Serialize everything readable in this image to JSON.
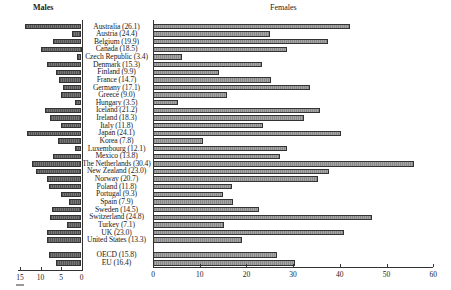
{
  "chart_data": {
    "type": "bar",
    "orientation": "horizontal",
    "layout": "back-to-back",
    "panels": [
      {
        "name": "Males",
        "axis_ticks": [
          15,
          10,
          5,
          0
        ],
        "xlim": [
          15,
          0
        ],
        "direction": "leftward"
      },
      {
        "name": "Females",
        "axis_ticks": [
          0,
          10,
          20,
          30,
          40,
          50,
          60
        ],
        "xlim": [
          0,
          60
        ],
        "direction": "rightward"
      }
    ],
    "categories": [
      "Australia (26.1)",
      "Austria (24.4)",
      "Belgium (19.9)",
      "Canada (18.5)",
      "Czech Republic (3.4)",
      "Denmark (15.3)",
      "Finland (9.9)",
      "France (14.7)",
      "Germany (17.1)",
      "Greece (9.0)",
      "Hungary (3.5)",
      "Iceland (21.2)",
      "Ireland (18.3)",
      "Italy (11.8)",
      "Japan (24.1)",
      "Korea (7.8)",
      "Luxembourg (12.1)",
      "Mexico (13.8)",
      "The Netherlands (30.4)",
      "New Zealand (23.0)",
      "Norway (20.7)",
      "Poland (11.8)",
      "Portugal (9.3)",
      "Spain (7.9)",
      "Sweden (14.5)",
      "Switzerland (24.8)",
      "Turkey (7.1)",
      "UK (23.0)",
      "United States (13.3)",
      "OECD (15.8)",
      "EU (16.4)"
    ],
    "series": [
      {
        "name": "Males",
        "values": [
          13.8,
          2.3,
          7.0,
          10.0,
          1.2,
          8.5,
          6.3,
          5.6,
          4.6,
          5.1,
          1.7,
          9.0,
          7.8,
          5.1,
          13.4,
          5.8,
          1.5,
          7.0,
          12.0,
          11.2,
          8.3,
          8.0,
          5.1,
          3.1,
          7.3,
          7.8,
          3.6,
          8.5,
          8.3,
          8.0,
          6.3
        ]
      },
      {
        "name": "Females",
        "values": [
          42.2,
          25.0,
          37.5,
          28.7,
          6.2,
          23.3,
          14.1,
          25.3,
          33.6,
          15.8,
          5.4,
          35.8,
          32.3,
          23.6,
          40.3,
          10.7,
          28.7,
          27.2,
          55.9,
          37.7,
          35.3,
          16.9,
          15.0,
          17.1,
          22.7,
          46.9,
          15.2,
          40.9,
          19.1,
          26.6,
          30.4
        ]
      }
    ],
    "title": "",
    "xlabel": "",
    "ylabel": "",
    "grid": false,
    "legend": "none"
  },
  "titles": {
    "males": "Males",
    "females": "Females"
  }
}
